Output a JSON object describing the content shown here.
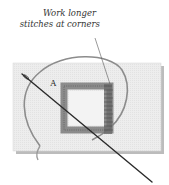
{
  "illustration": {
    "subject": "embroidery stitching around a square with needle and thread",
    "callout": {
      "line1": "Work longer",
      "line2": "stitches at corners"
    },
    "point_label": "A"
  },
  "colors": {
    "fabric": "#ececec",
    "fabric_shadow": "#bdbdbd",
    "thread": "#8a8a8a",
    "stitches": "#6e6e6e",
    "needle": "#2b2b2b",
    "text": "#333333"
  }
}
